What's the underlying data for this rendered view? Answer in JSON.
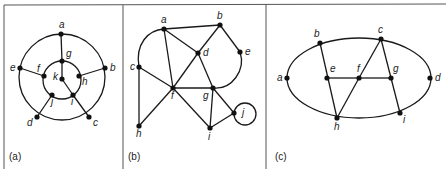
{
  "figure": {
    "panels": [
      {
        "id": "a",
        "label": "(a)",
        "nodes": [
          {
            "id": "a",
            "label": "a",
            "x": 61,
            "y": 34
          },
          {
            "id": "b",
            "label": "b",
            "x": 105,
            "y": 68
          },
          {
            "id": "c",
            "label": "c",
            "x": 89,
            "y": 117
          },
          {
            "id": "d",
            "label": "d",
            "x": 37,
            "y": 117
          },
          {
            "id": "e",
            "label": "e",
            "x": 20,
            "y": 68
          },
          {
            "id": "f",
            "label": "f",
            "x": 44,
            "y": 76
          },
          {
            "id": "g",
            "label": "g",
            "x": 62,
            "y": 61
          },
          {
            "id": "h",
            "label": "h",
            "x": 79,
            "y": 76
          },
          {
            "id": "i",
            "label": "i",
            "x": 73,
            "y": 95
          },
          {
            "id": "j",
            "label": "j",
            "x": 52,
            "y": 95
          },
          {
            "id": "k",
            "label": "k",
            "x": 62,
            "y": 79
          }
        ],
        "edges": [
          [
            "a",
            "g"
          ],
          [
            "b",
            "h"
          ],
          [
            "c",
            "i"
          ],
          [
            "d",
            "j"
          ],
          [
            "e",
            "f"
          ],
          [
            "g",
            "k"
          ],
          [
            "k",
            "i"
          ]
        ],
        "outer_cycle": [
          "a",
          "b",
          "c",
          "d",
          "e"
        ],
        "inner_cycle": [
          "g",
          "h",
          "i",
          "j",
          "f"
        ]
      },
      {
        "id": "b",
        "label": "(b)",
        "nodes": [
          {
            "id": "a",
            "label": "a",
            "x": 164,
            "y": 29
          },
          {
            "id": "b",
            "label": "b",
            "x": 220,
            "y": 25
          },
          {
            "id": "c",
            "label": "c",
            "x": 139,
            "y": 67
          },
          {
            "id": "d",
            "label": "d",
            "x": 198,
            "y": 53
          },
          {
            "id": "e",
            "label": "e",
            "x": 240,
            "y": 52
          },
          {
            "id": "f",
            "label": "f",
            "x": 173,
            "y": 88
          },
          {
            "id": "g",
            "label": "g",
            "x": 213,
            "y": 88
          },
          {
            "id": "h",
            "label": "h",
            "x": 139,
            "y": 126
          },
          {
            "id": "i",
            "label": "i",
            "x": 210,
            "y": 128
          },
          {
            "id": "j",
            "label": "j",
            "x": 234,
            "y": 113
          }
        ],
        "edges": [
          [
            "a",
            "b"
          ],
          [
            "a",
            "c"
          ],
          [
            "a",
            "f"
          ],
          [
            "a",
            "d"
          ],
          [
            "b",
            "d"
          ],
          [
            "b",
            "e"
          ],
          [
            "c",
            "f"
          ],
          [
            "c",
            "h"
          ],
          [
            "d",
            "f"
          ],
          [
            "d",
            "g"
          ],
          [
            "f",
            "g"
          ],
          [
            "f",
            "h"
          ],
          [
            "f",
            "i"
          ],
          [
            "g",
            "i"
          ],
          [
            "g",
            "j"
          ],
          [
            "i",
            "j"
          ]
        ],
        "curved_edges": [
          [
            "a",
            "c"
          ],
          [
            "e",
            "g"
          ]
        ],
        "loops": [
          "j"
        ]
      },
      {
        "id": "c",
        "label": "(c)",
        "nodes": [
          {
            "id": "a",
            "label": "a",
            "x": 287,
            "y": 78
          },
          {
            "id": "b",
            "label": "b",
            "x": 320,
            "y": 43
          },
          {
            "id": "c",
            "label": "c",
            "x": 381,
            "y": 39
          },
          {
            "id": "d",
            "label": "d",
            "x": 430,
            "y": 78
          },
          {
            "id": "e",
            "label": "e",
            "x": 327,
            "y": 78
          },
          {
            "id": "f",
            "label": "f",
            "x": 359,
            "y": 78
          },
          {
            "id": "g",
            "label": "g",
            "x": 391,
            "y": 78
          },
          {
            "id": "h",
            "label": "h",
            "x": 337,
            "y": 118
          },
          {
            "id": "i",
            "label": "i",
            "x": 400,
            "y": 113
          }
        ],
        "edges": [
          [
            "b",
            "h"
          ],
          [
            "c",
            "f"
          ],
          [
            "f",
            "h"
          ],
          [
            "c",
            "i"
          ],
          [
            "e",
            "f"
          ],
          [
            "f",
            "g"
          ]
        ],
        "ellipse": {
          "cx": 359,
          "cy": 78,
          "rx": 72,
          "ry": 40
        }
      }
    ]
  }
}
